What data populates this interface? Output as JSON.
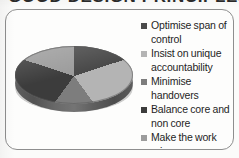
{
  "document": {
    "title_fragment": "GOOD DESIGN PRINCIPLES",
    "title_note": "cropped-heading"
  },
  "figure": {
    "frame_name": "chart-border"
  },
  "legend": {
    "items": [
      {
        "label": "Optimise span of control",
        "color": "#4a4a4a"
      },
      {
        "label": "Insist on unique accountability",
        "color": "#b4b4b4"
      },
      {
        "label": "Minimise handovers",
        "color": "#7d7d7d"
      },
      {
        "label": "Balance core and non core",
        "color": "#3c3c3c"
      },
      {
        "label": "Make the work prime",
        "color": "#9c9c9c"
      }
    ]
  },
  "chart_data": {
    "type": "pie",
    "title": "",
    "subtitle": "",
    "xlabel": "",
    "ylabel": "",
    "grid": false,
    "legend_position": "right",
    "three_d": true,
    "start_angle_deg": 0,
    "direction": "clockwise",
    "labels": [
      "Optimise span of control",
      "Insist on unique accountability",
      "Minimise handovers",
      "Balance core and non core",
      "Make the work prime"
    ],
    "values": [
      20,
      20,
      20,
      20,
      20
    ],
    "percentages": [
      20,
      20,
      20,
      20,
      20
    ],
    "colors": [
      "#4a4a4a",
      "#b4b4b4",
      "#7d7d7d",
      "#3c3c3c",
      "#9c9c9c"
    ],
    "annotations": []
  },
  "style": {
    "page_background": "#fbfbfa",
    "frame_border": "#8e8e8e",
    "text_color": "#1f1f1f"
  }
}
